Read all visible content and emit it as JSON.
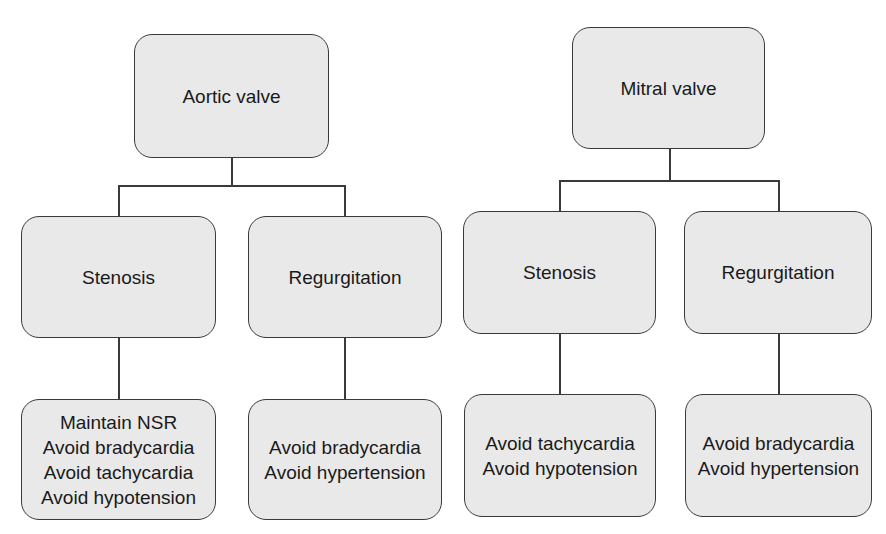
{
  "diagram": {
    "aortic": {
      "root": "Aortic valve",
      "stenosis": {
        "label": "Stenosis",
        "recommendations": [
          "Maintain NSR",
          "Avoid bradycardia",
          "Avoid tachycardia",
          "Avoid hypotension"
        ]
      },
      "regurgitation": {
        "label": "Regurgitation",
        "recommendations": [
          "Avoid bradycardia",
          "Avoid hypertension"
        ]
      }
    },
    "mitral": {
      "root": "Mitral valve",
      "stenosis": {
        "label": "Stenosis",
        "recommendations": [
          "Avoid tachycardia",
          "Avoid hypotension"
        ]
      },
      "regurgitation": {
        "label": "Regurgitation",
        "recommendations": [
          "Avoid bradycardia",
          "Avoid hypertension"
        ]
      }
    },
    "colors": {
      "box_fill": "#e9e9e9",
      "border": "#3a3a3a",
      "text": "#1a1a1a"
    }
  }
}
